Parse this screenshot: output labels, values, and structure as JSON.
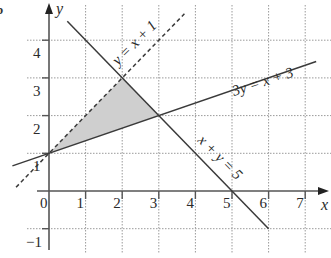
{
  "part_label": "b",
  "chart_data": {
    "type": "line",
    "title": "",
    "xlabel": "x",
    "ylabel": "y",
    "xlim": [
      -1.0,
      7.7
    ],
    "ylim": [
      -1.5,
      4.9
    ],
    "grid": true,
    "grid_style": "dotted",
    "x_ticks": [
      0,
      1,
      2,
      3,
      4,
      5,
      6,
      7
    ],
    "y_ticks": [
      -1,
      1,
      2,
      3,
      4
    ],
    "x_tick_labels": [
      "0",
      "1",
      "2",
      "3",
      "4",
      "5",
      "6",
      "7"
    ],
    "y_tick_labels": [
      "−1",
      "1",
      "2",
      "3",
      "4"
    ],
    "series": [
      {
        "name": "y = x + 1",
        "label": "y = x + 1",
        "style": "dashed",
        "x": [
          -0.9,
          3.7
        ],
        "y": [
          0.1,
          4.7
        ]
      },
      {
        "name": "3y = x + 3",
        "label": "3y = x + 3",
        "style": "solid",
        "x": [
          -1.0,
          7.3
        ],
        "y": [
          0.667,
          3.433
        ]
      },
      {
        "name": "x + y = 5",
        "label": "x + y = 5",
        "style": "solid",
        "x": [
          0.5,
          6.0
        ],
        "y": [
          4.5,
          -1.0
        ]
      }
    ],
    "shaded_region": {
      "description": "Triangle bounded by y = x + 1, 3y = x + 3 and x + y = 5",
      "vertices": [
        [
          0,
          1
        ],
        [
          2,
          3
        ],
        [
          3,
          2
        ]
      ],
      "color": "#cfcfcf"
    },
    "colors": {
      "line": "#3a3a3a",
      "grid": "#9a9a9a",
      "shade": "#cfcfcf",
      "text": "#2a2a2a"
    }
  }
}
